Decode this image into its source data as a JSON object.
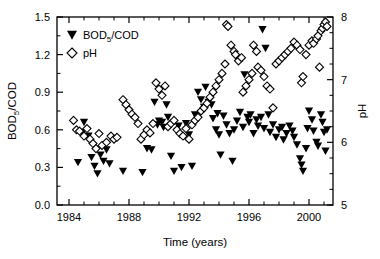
{
  "figure": {
    "background_color": "#ffffff",
    "foreground_color": "#000000"
  },
  "axes": {
    "x": {
      "title": "Time (years)",
      "ticks": [
        "1984",
        "1988",
        "1992",
        "1996",
        "2000"
      ],
      "tick_values": [
        1984,
        1988,
        1992,
        1996,
        2000
      ],
      "range": [
        1983.2,
        2001.6
      ],
      "minor_interval": 1
    },
    "y_left": {
      "title": "BOD5/COD",
      "title_main": "BOD",
      "title_sub": "5",
      "title_rest": "/COD",
      "ticks": [
        "0.0",
        "0.3",
        "0.6",
        "0.9",
        "1.2",
        "1.5"
      ],
      "tick_values": [
        0.0,
        0.3,
        0.6,
        0.9,
        1.2,
        1.5
      ],
      "range": [
        0.0,
        1.5
      ]
    },
    "y_right": {
      "title": "pH",
      "ticks": [
        "5",
        "6",
        "7",
        "8"
      ],
      "tick_values": [
        5,
        6,
        7,
        8
      ],
      "range": [
        5,
        8
      ],
      "minor_interval": 0.25
    }
  },
  "legend": {
    "position": "top-left-inside",
    "entries": [
      {
        "marker": "filled-down-triangle",
        "label": "BOD5/COD",
        "label_main": "BOD",
        "label_sub": "5",
        "label_rest": "/COD",
        "color": "#000000"
      },
      {
        "marker": "open-diamond",
        "label": "pH",
        "color": "#000000"
      }
    ]
  },
  "chart_data": {
    "type": "scatter",
    "title": "",
    "subtitle": "",
    "xlabel": "Time (years)",
    "ylabel": "BOD5/COD",
    "ylabel_right": "pH",
    "xlim": [
      1983.2,
      2001.6
    ],
    "ylim": [
      0.0,
      1.5
    ],
    "ylim_right": [
      5,
      8
    ],
    "grid": false,
    "legend_position": "top-left-inside",
    "series": [
      {
        "name": "BOD5/COD",
        "marker": "filled-down-triangle",
        "color": "#000000",
        "axis": "left",
        "points": [
          [
            1984.6,
            0.34
          ],
          [
            1984.9,
            0.58
          ],
          [
            1985.0,
            0.66
          ],
          [
            1985.3,
            0.55
          ],
          [
            1985.5,
            0.38
          ],
          [
            1985.7,
            0.31
          ],
          [
            1985.9,
            0.25
          ],
          [
            1986.1,
            0.4
          ],
          [
            1986.3,
            0.35
          ],
          [
            1986.5,
            0.44
          ],
          [
            1986.7,
            0.33
          ],
          [
            1987.6,
            0.27
          ],
          [
            1988.9,
            0.26
          ],
          [
            1989.2,
            0.45
          ],
          [
            1989.5,
            0.44
          ],
          [
            1989.7,
            0.82
          ],
          [
            1989.9,
            0.64
          ],
          [
            1990.0,
            0.67
          ],
          [
            1990.2,
            0.66
          ],
          [
            1990.3,
            0.62
          ],
          [
            1990.5,
            0.8
          ],
          [
            1990.6,
            0.7
          ],
          [
            1990.8,
            0.39
          ],
          [
            1991.0,
            0.27
          ],
          [
            1991.3,
            0.63
          ],
          [
            1991.5,
            0.3
          ],
          [
            1991.8,
            0.65
          ],
          [
            1992.0,
            0.56
          ],
          [
            1992.2,
            0.31
          ],
          [
            1992.4,
            0.72
          ],
          [
            1992.6,
            0.9
          ],
          [
            1992.8,
            0.84
          ],
          [
            1993.0,
            0.78
          ],
          [
            1993.1,
            0.94
          ],
          [
            1993.3,
            0.82
          ],
          [
            1993.5,
            0.8
          ],
          [
            1993.6,
            0.69
          ],
          [
            1993.8,
            0.6
          ],
          [
            1993.9,
            0.73
          ],
          [
            1994.0,
            0.56
          ],
          [
            1994.1,
            0.4
          ],
          [
            1994.3,
            0.71
          ],
          [
            1994.5,
            0.64
          ],
          [
            1994.7,
            0.57
          ],
          [
            1994.9,
            0.35
          ],
          [
            1995.0,
            0.6
          ],
          [
            1995.2,
            0.67
          ],
          [
            1995.4,
            0.74
          ],
          [
            1995.6,
            0.62
          ],
          [
            1995.7,
            1.04
          ],
          [
            1995.9,
            0.7
          ],
          [
            1996.0,
            0.66
          ],
          [
            1996.1,
            0.72
          ],
          [
            1996.3,
            0.57
          ],
          [
            1996.5,
            0.68
          ],
          [
            1996.6,
            0.63
          ],
          [
            1996.8,
            0.7
          ],
          [
            1996.9,
            1.4
          ],
          [
            1997.0,
            0.61
          ],
          [
            1997.1,
            1.25
          ],
          [
            1997.3,
            0.72
          ],
          [
            1997.4,
            0.58
          ],
          [
            1997.6,
            0.64
          ],
          [
            1997.8,
            0.54
          ],
          [
            1998.0,
            0.6
          ],
          [
            1998.2,
            0.62
          ],
          [
            1998.3,
            0.52
          ],
          [
            1998.5,
            0.57
          ],
          [
            1998.7,
            0.63
          ],
          [
            1998.9,
            0.59
          ],
          [
            1999.0,
            0.54
          ],
          [
            1999.2,
            0.48
          ],
          [
            1999.4,
            0.37
          ],
          [
            1999.5,
            0.32
          ],
          [
            1999.6,
            0.27
          ],
          [
            1999.8,
            0.45
          ],
          [
            1999.9,
            0.61
          ],
          [
            2000.0,
            0.75
          ],
          [
            2000.2,
            0.68
          ],
          [
            2000.3,
            0.59
          ],
          [
            2000.5,
            0.5
          ],
          [
            2000.6,
            0.47
          ],
          [
            2000.8,
            0.72
          ],
          [
            2000.9,
            0.66
          ],
          [
            2001.0,
            0.58
          ],
          [
            2001.1,
            0.43
          ],
          [
            2001.2,
            0.6
          ]
        ]
      },
      {
        "name": "pH",
        "marker": "open-diamond",
        "color": "#000000",
        "axis": "right",
        "points": [
          [
            1984.3,
            6.35
          ],
          [
            1984.5,
            6.2
          ],
          [
            1984.7,
            6.18
          ],
          [
            1985.0,
            6.1
          ],
          [
            1985.2,
            6.22
          ],
          [
            1985.4,
            6.05
          ],
          [
            1985.6,
            5.98
          ],
          [
            1985.8,
            5.9
          ],
          [
            1986.0,
            6.14
          ],
          [
            1986.2,
            5.95
          ],
          [
            1986.5,
            6.0
          ],
          [
            1986.8,
            6.1
          ],
          [
            1987.0,
            6.05
          ],
          [
            1987.2,
            6.08
          ],
          [
            1987.6,
            6.68
          ],
          [
            1987.8,
            6.6
          ],
          [
            1988.0,
            6.52
          ],
          [
            1988.2,
            6.45
          ],
          [
            1988.4,
            6.4
          ],
          [
            1988.6,
            6.3
          ],
          [
            1988.8,
            6.05
          ],
          [
            1989.0,
            6.12
          ],
          [
            1989.2,
            6.2
          ],
          [
            1989.4,
            6.15
          ],
          [
            1989.6,
            6.3
          ],
          [
            1989.8,
            6.95
          ],
          [
            1990.0,
            6.85
          ],
          [
            1990.2,
            6.75
          ],
          [
            1990.4,
            6.9
          ],
          [
            1990.6,
            6.25
          ],
          [
            1990.8,
            6.3
          ],
          [
            1991.0,
            6.35
          ],
          [
            1991.2,
            6.2
          ],
          [
            1991.4,
            6.14
          ],
          [
            1991.6,
            6.1
          ],
          [
            1991.8,
            6.22
          ],
          [
            1992.0,
            6.05
          ],
          [
            1992.2,
            6.28
          ],
          [
            1992.4,
            6.35
          ],
          [
            1992.6,
            6.4
          ],
          [
            1992.8,
            6.5
          ],
          [
            1993.0,
            6.55
          ],
          [
            1993.2,
            6.62
          ],
          [
            1993.4,
            6.72
          ],
          [
            1993.6,
            6.8
          ],
          [
            1993.8,
            6.9
          ],
          [
            1994.0,
            7.0
          ],
          [
            1994.2,
            7.1
          ],
          [
            1994.4,
            7.25
          ],
          [
            1994.5,
            7.88
          ],
          [
            1994.6,
            7.85
          ],
          [
            1994.8,
            7.55
          ],
          [
            1995.0,
            7.45
          ],
          [
            1995.1,
            7.4
          ],
          [
            1995.3,
            7.3
          ],
          [
            1995.5,
            7.35
          ],
          [
            1995.6,
            6.8
          ],
          [
            1995.8,
            6.9
          ],
          [
            1996.0,
            7.0
          ],
          [
            1996.2,
            7.1
          ],
          [
            1996.3,
            7.55
          ],
          [
            1996.5,
            7.45
          ],
          [
            1996.6,
            7.2
          ],
          [
            1996.8,
            7.15
          ],
          [
            1997.0,
            7.05
          ],
          [
            1997.2,
            6.9
          ],
          [
            1997.4,
            6.85
          ],
          [
            1997.6,
            6.55
          ],
          [
            1997.8,
            7.25
          ],
          [
            1998.0,
            7.3
          ],
          [
            1998.2,
            7.35
          ],
          [
            1998.4,
            7.4
          ],
          [
            1998.6,
            7.45
          ],
          [
            1998.8,
            7.5
          ],
          [
            1999.0,
            7.6
          ],
          [
            1999.2,
            7.55
          ],
          [
            1999.4,
            7.48
          ],
          [
            1999.5,
            6.95
          ],
          [
            1999.6,
            7.05
          ],
          [
            1999.8,
            7.4
          ],
          [
            2000.0,
            7.55
          ],
          [
            2000.2,
            7.62
          ],
          [
            2000.3,
            7.58
          ],
          [
            2000.5,
            7.65
          ],
          [
            2000.6,
            7.7
          ],
          [
            2000.7,
            7.2
          ],
          [
            2000.8,
            7.78
          ],
          [
            2000.9,
            7.82
          ],
          [
            2001.0,
            7.88
          ],
          [
            2001.1,
            7.92
          ],
          [
            2001.2,
            7.85
          ]
        ]
      }
    ]
  }
}
